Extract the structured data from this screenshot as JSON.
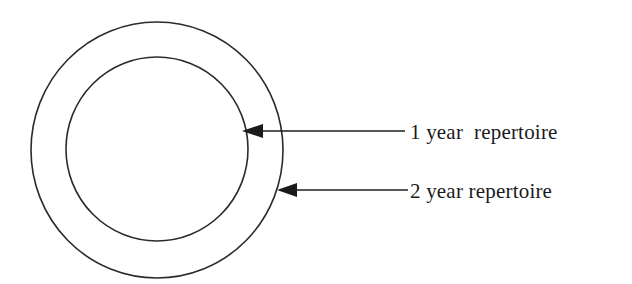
{
  "figure": {
    "background_color": "#ffffff",
    "stroke_color": "#2b2b2b",
    "text_color": "#1a1a1a"
  },
  "shapes": {
    "outer_circle": {
      "name": "2 year repertoire boundary",
      "cx": 157,
      "cy": 150,
      "rx": 126,
      "ry": 128
    },
    "inner_circle": {
      "name": "1 year repertoire boundary",
      "cx": 157,
      "cy": 149,
      "rx": 91,
      "ry": 92
    }
  },
  "callouts": [
    {
      "label": "1 year  repertoire",
      "target": "inner_circle",
      "arrow": {
        "tip_x": 242,
        "tip_y": 131,
        "tail_x": 405,
        "tail_y": 131,
        "head_length": 21,
        "head_half_height": 7
      },
      "text_x": 410,
      "text_y": 139
    },
    {
      "label": "2 year repertoire",
      "target": "outer_circle",
      "arrow": {
        "tip_x": 277,
        "tip_y": 190,
        "tail_x": 408,
        "tail_y": 190,
        "head_length": 20,
        "head_half_height": 7
      },
      "text_x": 410,
      "text_y": 198
    }
  ]
}
